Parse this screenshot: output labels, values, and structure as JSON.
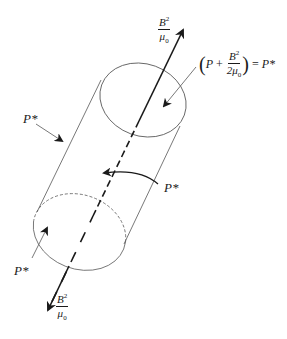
{
  "figure": {
    "type": "magnetic flux tube pressure balance",
    "colors": {
      "line": "#555555",
      "arrow": "#1a1a1a",
      "text": "#1a1a1a",
      "background": "#ffffff"
    }
  },
  "labels": {
    "top_tension": {
      "numerator": "B",
      "numerator_sup": "2",
      "denominator": "μ",
      "denominator_sub": "0"
    },
    "bottom_tension": {
      "numerator": "B",
      "numerator_sup": "2",
      "denominator": "μ",
      "denominator_sub": "0"
    },
    "pressure_equation": {
      "open_paren": "(",
      "P": "P",
      "plus": "+",
      "frac_numerator": "B",
      "frac_numerator_sup": "2",
      "frac_denominator": "2μ",
      "frac_denominator_sub": "0",
      "close_paren": ")",
      "equals": "=",
      "result": "P*"
    },
    "external_pressure_left": "P*",
    "external_pressure_right": "P*",
    "external_pressure_bottom": "P*"
  },
  "icons": {
    "top_arrow": "arrow-up-right-icon",
    "bottom_arrow": "arrow-down-left-icon",
    "inward_arrows": "arrow-inward-icon"
  }
}
